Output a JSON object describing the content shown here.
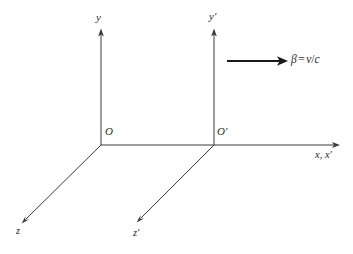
{
  "figure": {
    "kind": "coordinate-frames-diagram",
    "background_color": "#ffffff",
    "line_color": "#3a3a3a",
    "text_color": "#2b2b2b",
    "velocity_arrow_color": "#1a1a1a"
  },
  "labels": {
    "y_axis": "y",
    "y_prime_axis": "y′",
    "origin": "O",
    "origin_prime": "O′",
    "x_axes": "x, x′",
    "z_axis": "z",
    "z_prime_axis": "z′",
    "velocity": {
      "symbol": "β",
      "equals": "=",
      "numerator": "v",
      "slash": "/",
      "denominator": "c",
      "full": "β = v/c"
    }
  },
  "geometry": {
    "frame_unprimed": {
      "origin": [
        101,
        145
      ],
      "y_axis_tip": [
        101,
        29
      ],
      "z_axis_tip": [
        22,
        223
      ]
    },
    "frame_primed": {
      "origin": [
        214,
        145
      ],
      "y_axis_tip": [
        214,
        29
      ],
      "z_axis_tip": [
        137,
        222
      ]
    },
    "shared_x_axis": {
      "start": [
        101,
        145
      ],
      "tip": [
        340,
        145
      ]
    },
    "velocity_arrow": {
      "start": [
        227,
        61
      ],
      "tip": [
        287,
        61
      ]
    }
  }
}
